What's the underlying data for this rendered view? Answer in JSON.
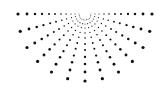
{
  "graphic": {
    "type": "half-sunburst-dot-pattern",
    "center": [
      85,
      14
    ],
    "ray_count": 13,
    "angle_start_deg": 0,
    "angle_end_deg": 180,
    "radii": [
      6,
      10,
      14,
      19,
      24,
      30,
      36,
      43,
      50,
      58,
      67
    ],
    "dot_color": "#111111",
    "background": "#ffffff"
  }
}
